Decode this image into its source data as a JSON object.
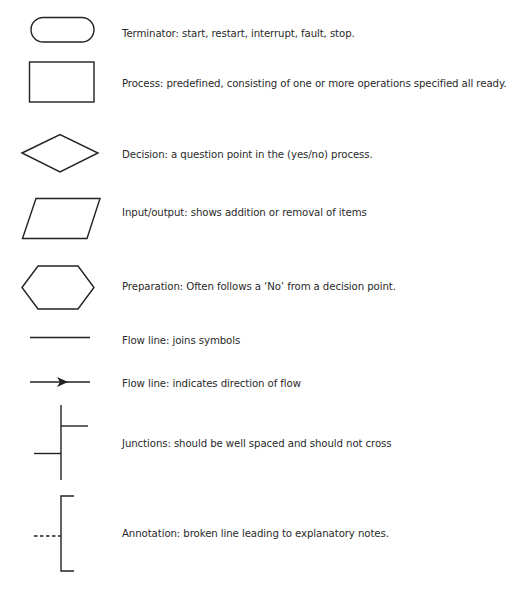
{
  "legend": {
    "items": [
      {
        "symbol": "terminator",
        "label": "Terminator: start, restart, interrupt, fault, stop."
      },
      {
        "symbol": "process",
        "label": "Process: predefined, consisting of one or more operations specified all ready."
      },
      {
        "symbol": "decision",
        "label": "Decision: a question point in the (yes/no) process."
      },
      {
        "symbol": "input-output",
        "label": "Input/output: shows addition or removal of items"
      },
      {
        "symbol": "preparation",
        "label": "Preparation: Often follows a ‘No’ from a decision point."
      },
      {
        "symbol": "flow-line",
        "label": "Flow line: joins symbols"
      },
      {
        "symbol": "flow-line-arrow",
        "label": "Flow line: indicates direction of flow"
      },
      {
        "symbol": "junctions",
        "label": "Junctions: should be well spaced and should not cross"
      },
      {
        "symbol": "annotation",
        "label": "Annotation: broken line leading to explanatory notes."
      }
    ]
  },
  "colors": {
    "stroke": "#222222",
    "text": "#2a2a2a",
    "background": "#ffffff"
  }
}
